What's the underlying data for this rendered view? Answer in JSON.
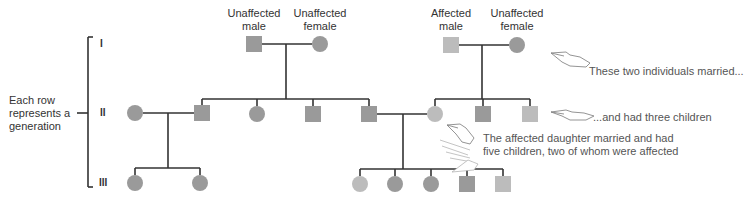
{
  "colors": {
    "unaffected": "#9a9a9a",
    "affected": "#bcbcbc",
    "line": "#333333",
    "text": "#333333",
    "note_text": "#555555"
  },
  "legend_labels": {
    "unaffected_male": "Unaffected\nmale",
    "unaffected_female": "Unaffected\nfemale",
    "affected_male": "Affected\nmale",
    "unaffected_female_2": "Unaffected\nfemale"
  },
  "legend_lines": {
    "unaffected_male": [
      "Unaffected",
      "male"
    ],
    "unaffected_female": [
      "Unaffected",
      "female"
    ],
    "affected_male": [
      "Affected",
      "male"
    ],
    "unaffected_female_2": [
      "Unaffected",
      "female"
    ]
  },
  "side_label": [
    "Each row",
    "represents a",
    "generation"
  ],
  "generations": [
    "I",
    "II",
    "III"
  ],
  "annotations": {
    "married": "These two individuals married...",
    "three_children": "...and had three children",
    "daughter_line1": "The affected daughter married and had",
    "daughter_line2": "five children, two of whom were affected"
  },
  "icons": [
    "pointing-hand-icon",
    "pointing-hand-icon",
    "pointing-hand-icon",
    "pointing-hand-icon"
  ],
  "individuals": {
    "gen1": [
      {
        "sex": "male",
        "affected": false
      },
      {
        "sex": "female",
        "affected": false
      },
      {
        "sex": "male",
        "affected": true
      },
      {
        "sex": "female",
        "affected": false
      }
    ],
    "gen2": [
      {
        "sex": "female",
        "affected": false
      },
      {
        "sex": "male",
        "affected": false
      },
      {
        "sex": "female",
        "affected": false
      },
      {
        "sex": "male",
        "affected": false
      },
      {
        "sex": "male",
        "affected": false
      },
      {
        "sex": "female",
        "affected": true
      },
      {
        "sex": "male",
        "affected": false
      },
      {
        "sex": "male",
        "affected": true
      }
    ],
    "gen3": [
      {
        "sex": "female",
        "affected": false
      },
      {
        "sex": "female",
        "affected": false
      },
      {
        "sex": "female",
        "affected": true
      },
      {
        "sex": "female",
        "affected": false
      },
      {
        "sex": "female",
        "affected": false
      },
      {
        "sex": "male",
        "affected": false
      },
      {
        "sex": "male",
        "affected": true
      }
    ]
  }
}
